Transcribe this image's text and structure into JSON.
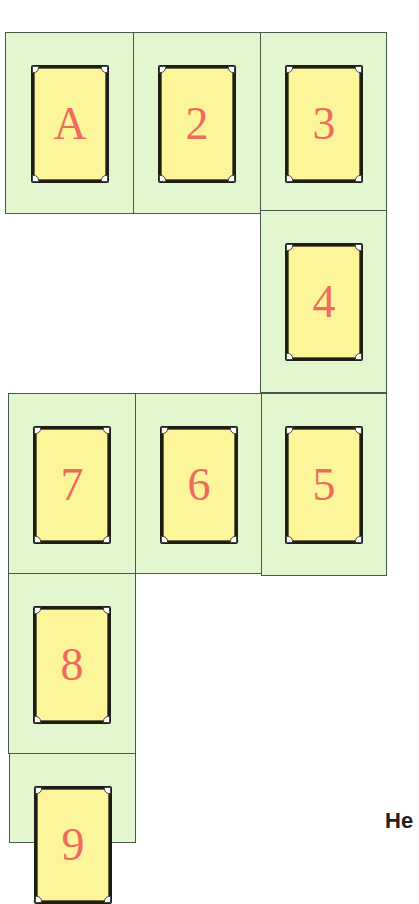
{
  "board": {
    "colors": {
      "tile_bg": "#e2f7cf",
      "card_bg": "#fdf59a",
      "label": "#ef6b5e",
      "border": "#1e1e14"
    },
    "tiles": [
      {
        "label": "A",
        "x": 5,
        "y": 32,
        "w": 129,
        "h": 182
      },
      {
        "label": "2",
        "x": 133,
        "y": 32,
        "w": 128,
        "h": 182
      },
      {
        "label": "3",
        "x": 260,
        "y": 32,
        "w": 127,
        "h": 180
      },
      {
        "label": "4",
        "x": 260,
        "y": 210,
        "w": 127,
        "h": 183
      },
      {
        "label": "5",
        "x": 261,
        "y": 393,
        "w": 126,
        "h": 183
      },
      {
        "label": "6",
        "x": 135,
        "y": 393,
        "w": 127,
        "h": 181
      },
      {
        "label": "7",
        "x": 8,
        "y": 393,
        "w": 128,
        "h": 181
      },
      {
        "label": "8",
        "x": 8,
        "y": 573,
        "w": 128,
        "h": 181
      },
      {
        "label": "9",
        "x": 9,
        "y": 753,
        "w": 127,
        "h": 90
      }
    ]
  },
  "footer": {
    "heading_partial": "He"
  }
}
